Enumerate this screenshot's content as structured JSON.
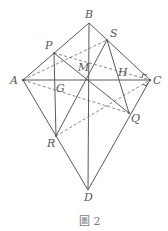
{
  "figure": {
    "caption": "圖 2",
    "stroke_color": "#5a5a5a",
    "points": {
      "A": {
        "label": "A",
        "x": 23,
        "y": 80
      },
      "B": {
        "label": "B",
        "x": 89,
        "y": 23
      },
      "C": {
        "label": "C",
        "x": 150,
        "y": 80
      },
      "D": {
        "label": "D",
        "x": 88,
        "y": 190
      },
      "M": {
        "label": "M",
        "x": 89,
        "y": 80
      },
      "P": {
        "label": "P",
        "x": 54,
        "y": 53
      },
      "S": {
        "label": "S",
        "x": 107,
        "y": 40
      },
      "Q": {
        "label": "Q",
        "x": 129,
        "y": 113
      },
      "R": {
        "label": "R",
        "x": 56,
        "y": 136
      },
      "G": {
        "label": "G",
        "x": 54,
        "y": 83
      },
      "H": {
        "label": "H",
        "x": 121,
        "y": 73
      }
    },
    "solid_segments": [
      [
        "A",
        "B"
      ],
      [
        "B",
        "C"
      ],
      [
        "C",
        "D"
      ],
      [
        "D",
        "A"
      ],
      [
        "A",
        "C"
      ],
      [
        "B",
        "D"
      ],
      [
        "P",
        "Q"
      ],
      [
        "S",
        "R"
      ],
      [
        "P",
        "R"
      ],
      [
        "S",
        "Q"
      ]
    ],
    "dashed_segments": [
      [
        "A",
        "S"
      ],
      [
        "P",
        "C"
      ],
      [
        "A",
        "Q"
      ],
      [
        "R",
        "C"
      ]
    ]
  }
}
